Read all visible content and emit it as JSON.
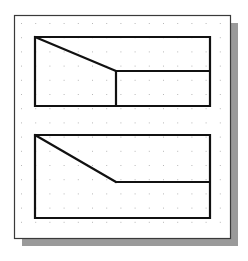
{
  "diagram": {
    "title": "",
    "colors": {
      "background": "#ffffff",
      "frame_border": "#3a3a3a",
      "shadow": "#9a9a9a",
      "grid_dot": "#b8b8b8",
      "stroke": "#111111"
    },
    "frame": {
      "x": 14,
      "y": 15,
      "width": 216,
      "height": 223,
      "shadow_offset": 8
    },
    "grid": {
      "x0": 21,
      "y0": 23,
      "spacing": 14.2,
      "cols": 15,
      "rows": 15
    },
    "shapes": [
      {
        "name": "upper-view",
        "outline": [
          [
            35,
            37
          ],
          [
            210,
            37
          ],
          [
            210,
            106
          ],
          [
            35,
            106
          ]
        ],
        "lines": [
          [
            [
              35,
              37
            ],
            [
              116,
              71
            ]
          ],
          [
            [
              116,
              71
            ],
            [
              210,
              71
            ]
          ],
          [
            [
              116,
              71
            ],
            [
              116,
              106
            ]
          ]
        ]
      },
      {
        "name": "lower-view",
        "outline": [
          [
            35,
            135
          ],
          [
            210,
            135
          ],
          [
            210,
            218
          ],
          [
            35,
            218
          ]
        ],
        "lines": [
          [
            [
              35,
              135
            ],
            [
              116,
              182
            ]
          ],
          [
            [
              116,
              182
            ],
            [
              210,
              182
            ]
          ]
        ]
      }
    ]
  }
}
